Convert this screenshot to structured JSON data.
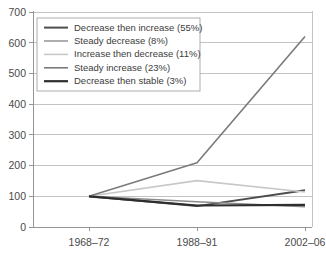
{
  "chart_data": {
    "type": "line",
    "title": "",
    "xlabel": "",
    "ylabel": "",
    "categories": [
      "1968–72",
      "1988–91",
      "2002–06"
    ],
    "ylim": [
      0,
      700
    ],
    "yticks": [
      0,
      100,
      200,
      300,
      400,
      500,
      600,
      700
    ],
    "ytick_labels": [
      "0",
      "100",
      "200",
      "300",
      "400",
      "500",
      "600",
      "700"
    ],
    "grid": true,
    "legend_position": "upper-left",
    "series": [
      {
        "name": "Decrease then increase (55%)",
        "label": "Decrease then increase (55%)",
        "color": "#4d4d4d",
        "width": 2.0,
        "values": [
          100,
          68,
          120
        ]
      },
      {
        "name": "Steady decrease (8%)",
        "label": "Steady decrease (8%)",
        "color": "#8c8c8c",
        "width": 1.4,
        "values": [
          100,
          82,
          66
        ]
      },
      {
        "name": "Increase then decrease (11%)",
        "label": "Increase then decrease (11%)",
        "color": "#c8c8c8",
        "width": 1.6,
        "values": [
          100,
          151,
          114
        ]
      },
      {
        "name": "Steady increase (23%)",
        "label": "Steady increase (23%)",
        "color": "#7a7a7a",
        "width": 1.6,
        "values": [
          100,
          209,
          620
        ]
      },
      {
        "name": "Decrease then stable (3%)",
        "label": "Decrease then stable (3%)",
        "color": "#2e2e2e",
        "width": 2.2,
        "values": [
          100,
          70,
          72
        ]
      }
    ]
  },
  "legend": {
    "items": [
      "Decrease then increase (55%)",
      "Steady decrease (8%)",
      "Increase then decrease (11%)",
      "Steady increase (23%)",
      "Decrease then stable (3%)"
    ]
  }
}
